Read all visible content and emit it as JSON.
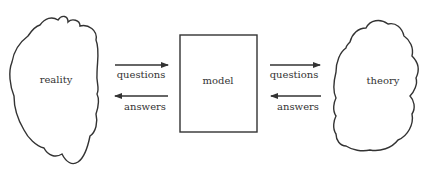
{
  "diagram": {
    "nodes": {
      "reality": {
        "label": "reality",
        "shape": "cloud"
      },
      "model": {
        "label": "model",
        "shape": "rectangle"
      },
      "theory": {
        "label": "theory",
        "shape": "cloud"
      }
    },
    "edges": {
      "reality_to_model": {
        "label": "questions",
        "direction": "right"
      },
      "model_to_reality": {
        "label": "answers",
        "direction": "left"
      },
      "model_to_theory": {
        "label": "questions",
        "direction": "right"
      },
      "theory_to_model": {
        "label": "answers",
        "direction": "left"
      }
    },
    "colors": {
      "stroke": "#333333",
      "background": "#ffffff"
    }
  }
}
